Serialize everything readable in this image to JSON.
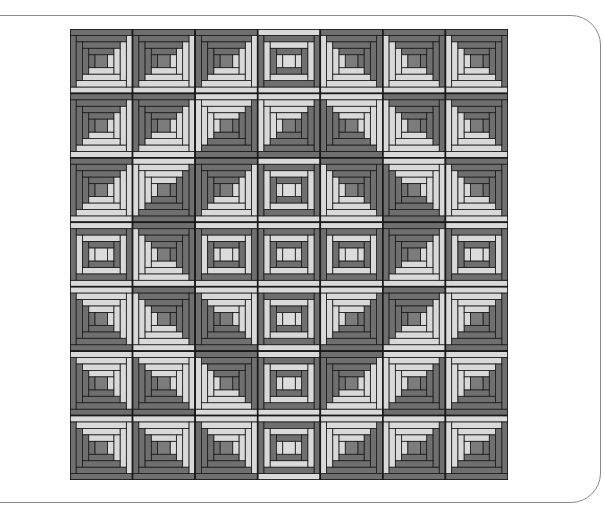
{
  "figure": {
    "grid": {
      "rows": 7,
      "cols": 7
    },
    "colors": {
      "dark": "#6f6f6f",
      "light": "#d9d9d9",
      "line": "#1a1a1a",
      "center_dark": "#7c7c7c",
      "center_light": "#dcdcdc"
    },
    "legend": {
      "TL": "dark top and left",
      "TR": "dark top and right",
      "BL": "dark bottom and left",
      "BR": "dark bottom and right",
      "C": "courthouse steps (concentric)"
    },
    "blocks": [
      [
        "TL",
        "TL",
        "TL",
        "C",
        "TR",
        "TR",
        "TR"
      ],
      [
        "TL",
        "TL",
        "BR",
        "BR",
        "BL",
        "TR",
        "TR"
      ],
      [
        "TL",
        "BR",
        "TL",
        "C",
        "TR",
        "BL",
        "TR"
      ],
      [
        "C",
        "TR",
        "C",
        "C",
        "C",
        "TL",
        "C"
      ],
      [
        "BL",
        "TR",
        "BL",
        "C",
        "BR",
        "TL",
        "BR"
      ],
      [
        "BL",
        "BL",
        "TR",
        "C",
        "TL",
        "BR",
        "BR"
      ],
      [
        "BL",
        "BL",
        "BL",
        "C",
        "BR",
        "BR",
        "BR"
      ]
    ]
  }
}
